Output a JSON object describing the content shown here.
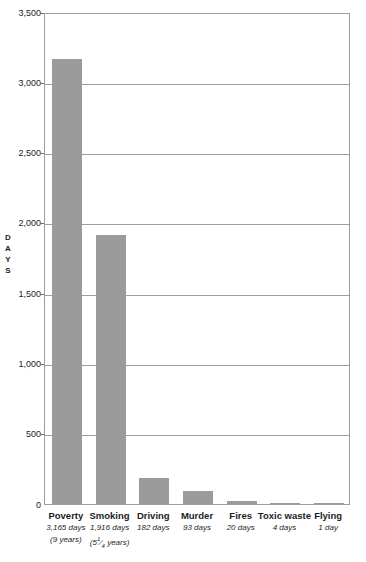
{
  "chart_data": {
    "type": "bar",
    "title": "",
    "subtitle": "",
    "xlabel": "",
    "ylabel": "DAYS",
    "ylabel_spaced": "D A Y S",
    "ylim": [
      0,
      3500
    ],
    "ytick_labels": [
      "3,500",
      "3,000",
      "2,500",
      "2,000",
      "1,500",
      "1,000",
      "500",
      "0"
    ],
    "ytick_values": [
      3500,
      3000,
      2500,
      2000,
      1500,
      1000,
      500,
      0
    ],
    "grid": "horizontal",
    "legend": "none",
    "bar_color": "#9b9b9b",
    "axis_color": "#9d9d9d",
    "categories": [
      "Poverty",
      "Smoking",
      "Driving",
      "Murder",
      "Fires",
      "Toxic waste",
      "Flying"
    ],
    "values": [
      3165,
      1916,
      182,
      93,
      20,
      4,
      1
    ],
    "annotations": [
      {
        "category": "Poverty",
        "days_label": "3,165 days",
        "years_label": "(9 years)"
      },
      {
        "category": "Smoking",
        "days_label": "1,916 days",
        "years_label": "(5¼ years)",
        "years_whole": "(5",
        "years_num": "1",
        "years_den": "4",
        "years_tail": " years)"
      },
      {
        "category": "Driving",
        "days_label": "182 days",
        "years_label": ""
      },
      {
        "category": "Murder",
        "days_label": "93 days",
        "years_label": ""
      },
      {
        "category": "Fires",
        "days_label": "20 days",
        "years_label": ""
      },
      {
        "category": "Toxic waste",
        "days_label": "4 days",
        "years_label": ""
      },
      {
        "category": "Flying",
        "days_label": "1 day",
        "years_label": ""
      }
    ]
  }
}
